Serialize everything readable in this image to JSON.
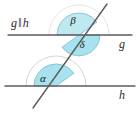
{
  "figure": {
    "background_color": "#ffffff",
    "width": 140,
    "height": 113
  },
  "notation": {
    "parallel_statement": "g‖h",
    "parallel_statement_parts": {
      "first_line": "g",
      "parallel_symbol": "‖",
      "second_line": "h"
    }
  },
  "lines": [
    {
      "name": "line-g",
      "label": "g",
      "orientation": "horizontal",
      "y": 35,
      "x_start": 8,
      "x_end": 132,
      "color": "#5c5c5c",
      "label_x": 122,
      "label_y": 45
    },
    {
      "name": "line-h",
      "label": "h",
      "orientation": "horizontal",
      "y": 86,
      "x_start": 5,
      "x_end": 135,
      "color": "#5c5c5c",
      "label_x": 122,
      "label_y": 96
    },
    {
      "name": "transversal",
      "label": "",
      "orientation": "oblique",
      "x_start": 107,
      "y_start": 4,
      "x_end": 33,
      "y_end": 108,
      "color": "#5c5c5c"
    }
  ],
  "intersections": [
    {
      "name": "intersection-g",
      "x": 79,
      "y": 35
    },
    {
      "name": "intersection-h",
      "x": 56,
      "y": 86
    }
  ],
  "angles": [
    {
      "name": "angle-beta",
      "label": "β",
      "vertex": "intersection-g",
      "position": "above line g, left of transversal",
      "fill": "#bfe9f0",
      "stroke": "#7fb9c9",
      "radius": 22,
      "label_x": 73,
      "label_y": 21
    },
    {
      "name": "angle-delta",
      "label": "δ",
      "vertex": "intersection-g",
      "position": "below line g, right of transversal",
      "fill": "#a8e2ee",
      "stroke": "#7fb9c9",
      "radius": 21,
      "label_x": 82,
      "label_y": 45
    },
    {
      "name": "angle-alpha",
      "label": "α",
      "vertex": "intersection-h",
      "position": "above line h, left of transversal",
      "fill": "#a8e2ee",
      "stroke": "#7fb9c9",
      "radius": 22,
      "outer_radius": 30,
      "label_x": 43,
      "label_y": 79
    }
  ],
  "colors": {
    "line": "#5c5c5c",
    "angle_fill": "#a8e2ee",
    "angle_fill_light": "#bfe9f0",
    "angle_stroke": "#7fb9c9",
    "text": "#2b2b2b",
    "background": "#ffffff"
  }
}
